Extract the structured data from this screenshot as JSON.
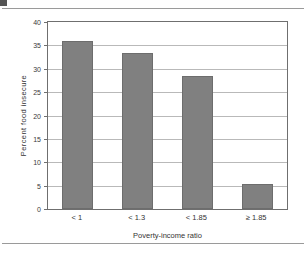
{
  "figure": {
    "corner_mark": "",
    "background_color": "#ffffff",
    "rule_color": "#9a9a9a"
  },
  "chart_data": {
    "type": "bar",
    "title": "",
    "subtitle": "",
    "xlabel": "Poverty-income ratio",
    "ylabel": "Percent food insecure",
    "categories": [
      "< 1",
      "< 1.3",
      "< 1.85",
      "≥ 1.85"
    ],
    "values": [
      36.0,
      33.3,
      28.5,
      5.4
    ],
    "ylim": [
      0,
      40
    ],
    "ytick_labels": [
      "0",
      "5",
      "10",
      "15",
      "20",
      "25",
      "30",
      "35",
      "40"
    ],
    "ytick_values": [
      0,
      5,
      10,
      15,
      20,
      25,
      30,
      35,
      40
    ],
    "grid": true,
    "grid_axis": "y",
    "legend": "none",
    "bar_color": "#808080",
    "bar_edge_color": "#6d6d6d",
    "grid_color": "#b9b9b9",
    "axis_color": "#6f6f6f",
    "annotations": []
  }
}
